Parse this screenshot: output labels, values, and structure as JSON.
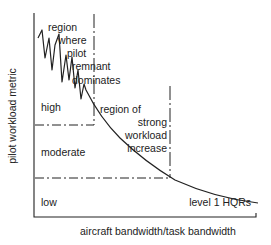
{
  "diagram": {
    "axes": {
      "xlabel": "aircraft bandwidth/task bandwidth",
      "ylabel": "pilot workload metric"
    },
    "levels": {
      "high": "high",
      "moderate": "moderate",
      "low": "low"
    },
    "regions": {
      "remnant": [
        "region",
        "where",
        "pilot",
        "remnant",
        "dominates"
      ],
      "strong_increase": [
        "region of",
        "strong",
        "workload",
        "increase"
      ]
    },
    "annotation": "level 1 HQRs",
    "colors": {
      "line": "#222222",
      "background": "#ffffff"
    }
  }
}
